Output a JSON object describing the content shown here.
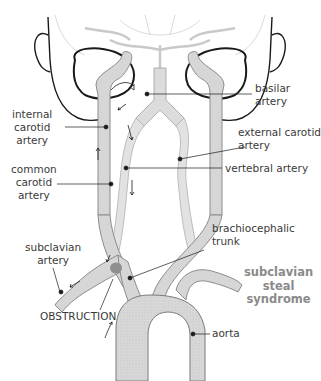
{
  "figure": {
    "title": "subclavian steal syndrome",
    "title_lines": [
      "subclavian",
      "steal",
      "syndrome"
    ],
    "colors": {
      "vessel_fill": "#d6d6d6",
      "vessel_outline": "#8c8c8c",
      "outline_dark": "#1a1a1a",
      "obstruction": "#8f8f8f",
      "label_text": "#3a3a3a",
      "title_text": "#8a8a8a"
    }
  },
  "labels": {
    "basilar_artery": [
      "basilar",
      "artery"
    ],
    "internal_carotid_artery": [
      "internal",
      "carotid",
      "artery"
    ],
    "external_carotid_artery": [
      "external carotid",
      "artery"
    ],
    "vertebral_artery": "vertebral artery",
    "common_carotid_artery": [
      "common",
      "carotid",
      "artery"
    ],
    "brachiocephalic_trunk": [
      "brachiocephalic",
      "trunk"
    ],
    "subclavian_artery": [
      "subclavian",
      "artery"
    ],
    "obstruction": "OBSTRUCTION",
    "aorta": "aorta"
  }
}
